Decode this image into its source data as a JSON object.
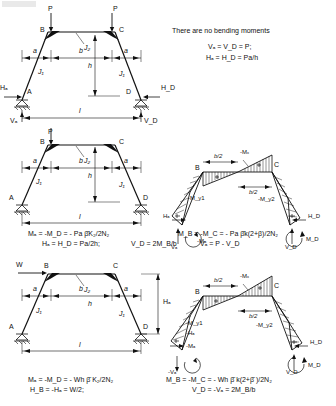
{
  "page": {
    "width": 336,
    "height": 406,
    "ink_color": "#111111",
    "background": "#ffffff"
  },
  "case_top": {
    "name": "symmetrical-two-point-loads",
    "note": "There are no bending moments",
    "formulas": [
      "Vₐ = V_D = P;",
      "Hₐ = H_D = Pa/h"
    ],
    "load_labels": [
      "P",
      "P"
    ],
    "joint_labels": [
      "B",
      "C",
      "A",
      "D"
    ],
    "stiffness_labels": [
      "J₂",
      "J₁",
      "J₁"
    ],
    "dimension_labels": [
      "a",
      "b",
      "a",
      "h",
      "l"
    ],
    "reaction_labels": [
      "Hₐ",
      "H_D",
      "Vₐ",
      "V_D"
    ]
  },
  "case_middle": {
    "name": "single-vertical-load-at-B",
    "load_labels": [
      "P"
    ],
    "joint_labels": [
      "B",
      "C",
      "A",
      "D"
    ],
    "stiffness_labels": [
      "J₂",
      "J₁",
      "J₁"
    ],
    "dimension_labels": [
      "a",
      "b",
      "a",
      "h",
      "l"
    ],
    "formulas_left": [
      "Mₐ = -M_D = - Pa β̄K₂/2N₂",
      "Hₐ = H_D = Pa/2h;"
    ],
    "formulas_right": [
      "M_B = -M_C = - Pa β̄k(2+β)/2N₂",
      "V_D = 2M_B/b",
      "Vₐ = P - V_D"
    ],
    "bmd_labels": [
      "B",
      "C",
      "b/2",
      "b/2",
      "-Mₓ",
      "-M_y1",
      "-M_y2",
      "Hₐ",
      "H_D",
      "Vₐ",
      "V_D",
      "-Mₐ",
      "M_D"
    ]
  },
  "case_bottom": {
    "name": "single-horizontal-load-at-B",
    "load_labels": [
      "W"
    ],
    "joint_labels": [
      "B",
      "C",
      "A",
      "D"
    ],
    "stiffness_labels": [
      "J₂",
      "J₁",
      "J₁"
    ],
    "dimension_labels": [
      "a",
      "b",
      "a",
      "h",
      "l"
    ],
    "formulas_left": [
      "Mₐ = -M_D = - Wh β̄ K₂/2N₂",
      "H_B = -Hₐ = W/2;"
    ],
    "formulas_right": [
      "M_B = -M_C = - Wh β̄ k(2+β̄ )/2N₂",
      "V_D = -Vₐ = 2M_B/b"
    ],
    "bmd_labels": [
      "B",
      "C",
      "b/2",
      "b/2",
      "-Mₓ",
      "-M_y1",
      "-M_y2",
      "Hₐ",
      "H_D",
      "-Hₐ",
      "-Vₐ",
      "V_D",
      "-Mₐ",
      "M_D"
    ],
    "side_label": "Hₐ"
  }
}
